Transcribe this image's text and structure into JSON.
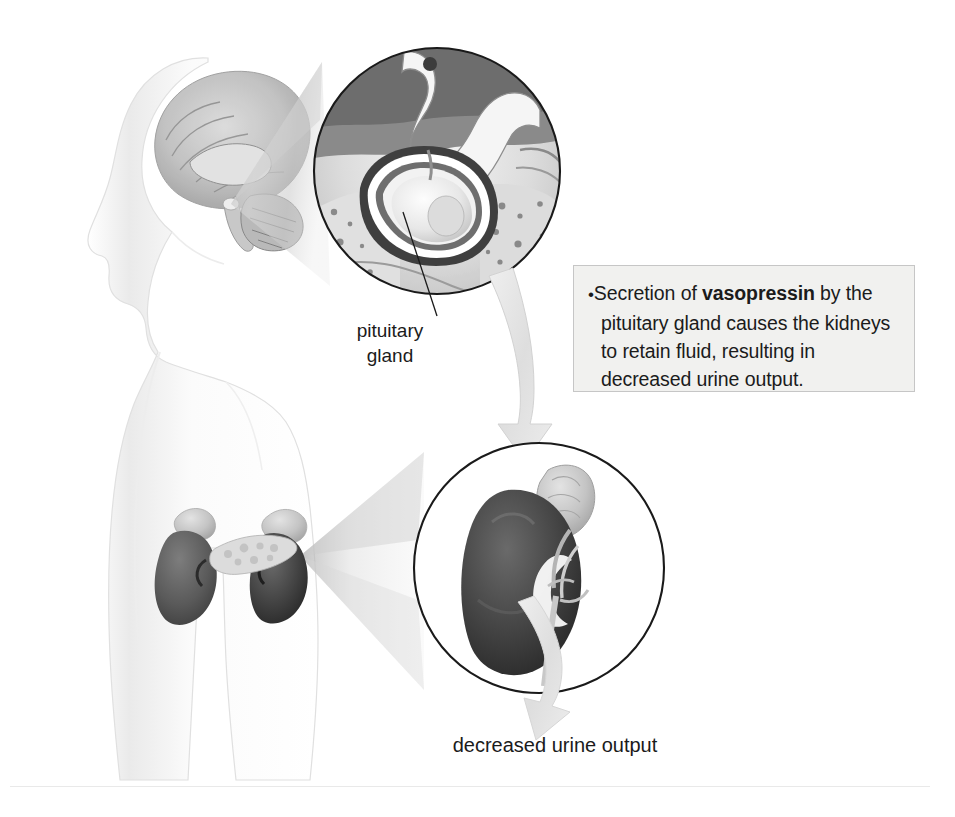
{
  "figure": {
    "domain": "anatomy-diagram",
    "background_color": "#ffffff",
    "width": 955,
    "height": 817
  },
  "callout": {
    "bullet_glyph": "•",
    "line1_a": "Secretion of ",
    "emphasis": "vasopressin",
    "line1_b": " by the",
    "line2": "pituitary gland causes the kidneys",
    "line3": "to retain fluid, resulting in",
    "line4": "decreased urine output.",
    "full_text": "• Secretion of vasopressin by the pituitary gland causes the kidneys to retain fluid, resulting in decreased urine output.",
    "background_color": "#f1f1ef",
    "border_color": "#c6c6c6",
    "text_color": "#1b1b1b"
  },
  "labels": {
    "pituitary_gland": "pituitary\ngland",
    "decreased_urine_output": "decreased urine output"
  },
  "illustration": {
    "body_figure": {
      "name": "human-body-silhouette",
      "description": "faint grey outline of a head in left profile and upper torso",
      "outline_color": "#e3e3e3"
    },
    "brain": {
      "name": "brain-sagittal-section",
      "description": "mid-sagittal brain section rendered inside the head"
    },
    "kidneys_in_body": {
      "name": "kidneys-and-adrenal-glands",
      "description": "pair of dark kidneys with pale adrenal glands and pancreas",
      "fill_color": "#5d5d5d"
    },
    "inset_pituitary": {
      "name": "pituitary-gland-inset",
      "description": "circular magnified cross-section of the sella turcica and pituitary gland",
      "center_x": 437,
      "center_y": 171,
      "radius": 124,
      "border_color": "#1a1a1a"
    },
    "inset_kidney": {
      "name": "kidney-inset",
      "description": "circular magnified view of a single kidney with adrenal gland and renal vessels",
      "center_x": 539,
      "center_y": 568,
      "radius": 126,
      "border_color": "#1a1a1a",
      "kidney_fill": "#3a3a3a"
    },
    "magnifier_cone_head": {
      "name": "magnification-cone-head",
      "description": "translucent grey cone linking the head to the pituitary inset"
    },
    "magnifier_cone_kidney": {
      "name": "magnification-cone-kidney",
      "description": "translucent grey cone linking the body kidney to the kidney inset"
    },
    "arrow_pituitary_to_kidney": {
      "name": "flow-arrow-pituitary-to-kidney",
      "description": "large pale grey curved arrow running from the pituitary inset down to the kidney inset",
      "fill_color": "#e2e2e2"
    },
    "arrow_kidney_to_output": {
      "name": "flow-arrow-kidney-to-output",
      "description": "pale grey arrow running from the kidney inset down to the decreased urine output label",
      "fill_color": "#e2e2e2"
    },
    "leader_line_pituitary": {
      "name": "leader-line-pituitary-gland",
      "description": "thin black line from the pituitary gland in the inset to its label",
      "stroke_color": "#1a1a1a"
    }
  }
}
